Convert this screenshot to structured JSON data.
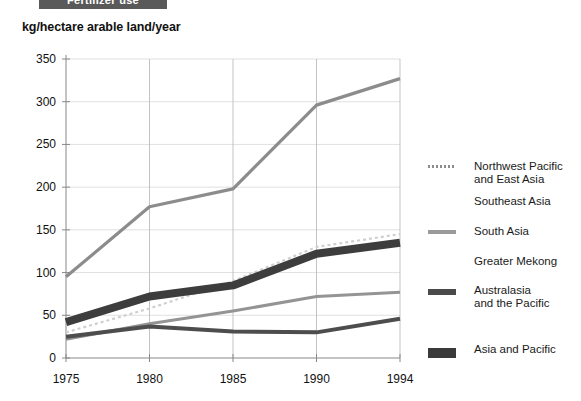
{
  "banner": {
    "title": "Fertilizer use"
  },
  "axis_title": "kg/hectare arable land/year",
  "legend": {
    "items": [
      {
        "label": "Northwest Pacific\nand East Asia",
        "color": "#8c8c8c",
        "style": "dotted-thin",
        "top": 10
      },
      {
        "label": "Southeast Asia",
        "color": "#c8c8c8",
        "style": "none",
        "top": 45
      },
      {
        "label": "South Asia",
        "color": "#9a9a9a",
        "style": "solid-medium",
        "top": 75
      },
      {
        "label": "Greater Mekong",
        "color": "#d4d4d4",
        "style": "none",
        "top": 105
      },
      {
        "label": "Australasia\nand the Pacific",
        "color": "#4a4a4a",
        "style": "solid-thick",
        "top": 134
      },
      {
        "label": "Asia and Pacific",
        "color": "#3a3a3a",
        "style": "solid-very-thick",
        "top": 193
      }
    ]
  },
  "chart_data": {
    "type": "line",
    "title": "Fertilizer use",
    "xlabel": "",
    "ylabel": "kg/hectare arable land/year",
    "x": [
      1975,
      1980,
      1985,
      1990,
      1994
    ],
    "xtick_labels": [
      "1975",
      "1980",
      "1985",
      "1990",
      "1994"
    ],
    "ytick_labels": [
      "0",
      "50",
      "100",
      "150",
      "200",
      "250",
      "300",
      "350"
    ],
    "yticks": [
      0,
      50,
      100,
      150,
      200,
      250,
      300,
      350
    ],
    "ylim": [
      0,
      350
    ],
    "grid": true,
    "legend_position": "right",
    "series": [
      {
        "name": "Northwest Pacific and East Asia",
        "values": [
          95,
          177,
          198,
          296,
          327
        ],
        "color": "#8c8c8c",
        "width": 3.2,
        "dash": ""
      },
      {
        "name": "Southeast Asia",
        "values": [
          30,
          58,
          90,
          130,
          145
        ],
        "color": "#cfcfcf",
        "width": 2.2,
        "dash": "3 3"
      },
      {
        "name": "South Asia",
        "values": [
          22,
          40,
          55,
          72,
          77
        ],
        "color": "#949494",
        "width": 3.0,
        "dash": ""
      },
      {
        "name": "Greater Mekong",
        "values": [
          25,
          37,
          31,
          30,
          46
        ],
        "color": "#4d4d4d",
        "width": 4.0,
        "dash": ""
      },
      {
        "name": "Australasia and the Pacific",
        "values": [
          42,
          72,
          85,
          122,
          135
        ],
        "color": "#3d3d3d",
        "width": 8.0,
        "dash": ""
      },
      {
        "name": "Asia and Pacific",
        "values": [
          42,
          72,
          85,
          122,
          135
        ],
        "color": "#3d3d3d",
        "width": 0,
        "dash": ""
      }
    ]
  }
}
